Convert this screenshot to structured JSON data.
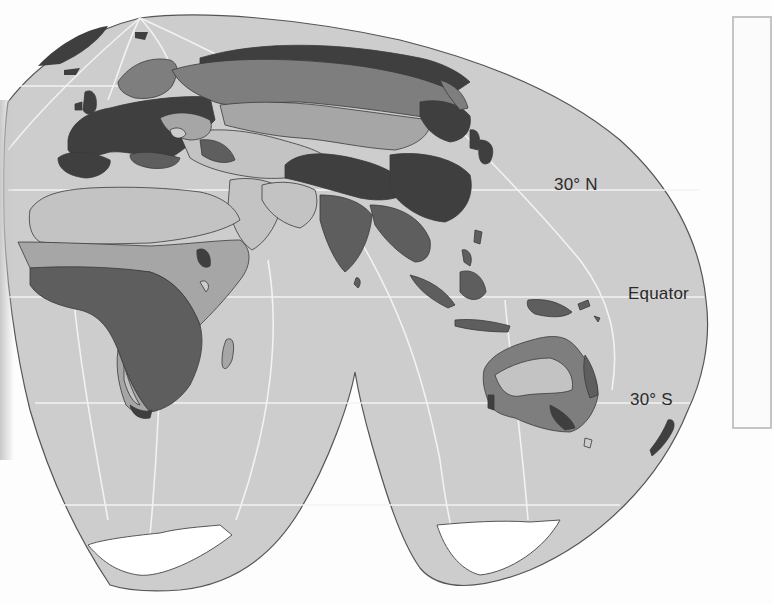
{
  "figure": {
    "type": "interrupted world map (eastern hemisphere lobes)",
    "latitude_labels": {
      "north30": "30° N",
      "equator": "Equator",
      "south30": "30° S"
    },
    "regions_depicted": [
      "Europe",
      "Africa",
      "Asia",
      "Australia",
      "Antarctica"
    ],
    "legend": {
      "visible": "partial (border only, content cropped)"
    }
  },
  "colors": {
    "ocean": "#cdcdcd",
    "zone_darkest": "#3f3f3f",
    "zone_dark": "#5e5e5e",
    "zone_medium": "#7e7e7e",
    "zone_light": "#a6a6a6",
    "zone_lightest": "#c3c3c3",
    "ice": "#ffffff",
    "graticule": "#ffffff",
    "outline": "#505050",
    "legend_border": "#c4c4c4"
  }
}
